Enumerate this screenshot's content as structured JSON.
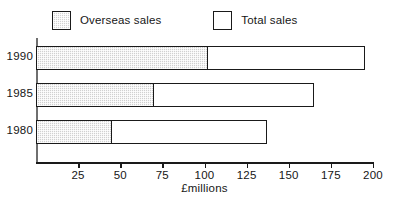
{
  "legend": {
    "entries": [
      {
        "label": "Overseas sales",
        "swatch": "shaded-square-icon"
      },
      {
        "label": "Total sales",
        "swatch": "open-square-icon"
      }
    ]
  },
  "axis": {
    "x_title": "£millions",
    "x_ticks": [
      "25",
      "50",
      "75",
      "100",
      "125",
      "150",
      "175",
      "200"
    ],
    "y_ticks": [
      "1990",
      "1985",
      "1980"
    ]
  },
  "chart_data": {
    "type": "bar",
    "orientation": "horizontal",
    "title": "",
    "xlabel": "£millions",
    "ylabel": "",
    "categories": [
      "1990",
      "1985",
      "1980"
    ],
    "series": [
      {
        "name": "Overseas sales",
        "values": [
          102,
          70,
          45
        ]
      },
      {
        "name": "Total sales",
        "values": [
          195,
          165,
          137
        ]
      }
    ],
    "xlim": [
      0,
      200
    ],
    "xticks": [
      0,
      25,
      50,
      75,
      100,
      125,
      150,
      175,
      200
    ],
    "grid": false,
    "legend_position": "top-left"
  }
}
